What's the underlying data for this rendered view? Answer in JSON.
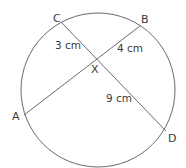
{
  "diagram": {
    "type": "intersecting-chords",
    "colors": {
      "stroke": "#6b6b6b",
      "text": "#3a3a3a",
      "background": "#ffffff"
    },
    "circle": {
      "cx": 98,
      "cy": 90,
      "r": 77
    },
    "points": {
      "C": {
        "label": "C",
        "x": 61,
        "y": 22
      },
      "B": {
        "label": "B",
        "x": 140,
        "y": 26
      },
      "A": {
        "label": "A",
        "x": 24,
        "y": 115
      },
      "D": {
        "label": "D",
        "x": 166,
        "y": 131
      },
      "X": {
        "label": "X",
        "x": 95,
        "y": 59
      }
    },
    "chords": [
      {
        "name": "CD",
        "from": "C",
        "to": "D"
      },
      {
        "name": "AB",
        "from": "A",
        "to": "B"
      }
    ],
    "lengths": {
      "CX": "3 cm",
      "XB": "4 cm",
      "XD": "9 cm"
    }
  }
}
